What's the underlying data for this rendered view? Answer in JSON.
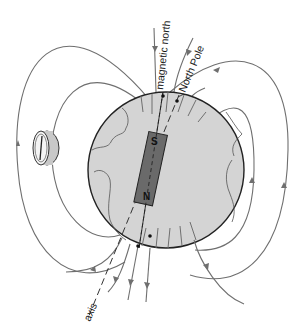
{
  "diagram": {
    "labels": {
      "magnetic_north": "magnetic north",
      "north_pole": "North Pole",
      "axis": "axis"
    },
    "magnet": {
      "top_pole": "S",
      "bottom_pole": "N"
    },
    "elements": [
      "earth-globe",
      "bar-magnet",
      "compass",
      "magnetic-field-lines",
      "rotation-axis"
    ],
    "colors": {
      "globe_fill": "#d4d4d4",
      "magnet_fill": "#6a6a6a",
      "field_lines": "#6f6f6f",
      "outline": "#222222"
    }
  }
}
